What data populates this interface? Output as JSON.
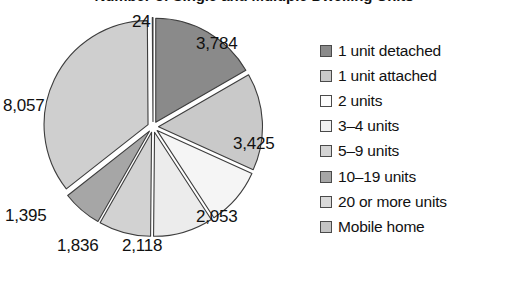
{
  "chart_data": {
    "type": "pie",
    "title": "Number of Single and Multiple Dwelling Units",
    "title_cropped": true,
    "units": "thousands of units",
    "categories": [
      "1 unit detached",
      "1 unit attached",
      "2 units",
      "3–4 units",
      "5–9 units",
      "10–19 units",
      "20 or more units",
      "Mobile home"
    ],
    "values": [
      3784,
      3425,
      2053,
      2118,
      1836,
      1395,
      8057,
      24
    ],
    "value_labels": [
      "3,784",
      "3,425",
      "2,053",
      "2,118",
      "1,836",
      "1,395",
      "8,057",
      "24"
    ],
    "colors": [
      "#8a8a8a",
      "#c9c9c9",
      "#f5f5f5",
      "#ececec",
      "#d2d2d2",
      "#a6a6a6",
      "#cfcfcf",
      "#c2c2c2"
    ],
    "total": 22692,
    "exploded": true,
    "legend_position": "right",
    "grid": false,
    "start_angle_deg": 0,
    "direction": "clockwise"
  },
  "figure": {
    "title": "Number of Single and Multiple Dwelling Units"
  },
  "labels": [
    {
      "text": "24",
      "x": 132,
      "y": 4,
      "align": "left"
    },
    {
      "text": "3,784",
      "x": 196,
      "y": 26,
      "align": "left"
    },
    {
      "text": "3,425",
      "x": 233,
      "y": 126,
      "align": "left"
    },
    {
      "text": "2,053",
      "x": 196,
      "y": 199,
      "align": "left"
    },
    {
      "text": "2,118",
      "x": 122,
      "y": 228,
      "align": "left"
    },
    {
      "text": "1,836",
      "x": 57,
      "y": 228,
      "align": "left"
    },
    {
      "text": "1,395",
      "x": 5,
      "y": 198,
      "align": "left"
    },
    {
      "text": "8,057",
      "x": 3,
      "y": 88,
      "align": "left"
    }
  ],
  "legend": {
    "items": [
      {
        "label": "1 unit detached",
        "color": "#8a8a8a"
      },
      {
        "label": "1 unit attached",
        "color": "#c9c9c9"
      },
      {
        "label": "2 units",
        "color": "#fcfcfc"
      },
      {
        "label": "3–4 units",
        "color": "#f0f0f0"
      },
      {
        "label": "5–9 units",
        "color": "#d4d4d4"
      },
      {
        "label": "10–19 units",
        "color": "#a6a6a6"
      },
      {
        "label": "20 or more units",
        "color": "#d9d9d9"
      },
      {
        "label": "Mobile home",
        "color": "#c4c4c4"
      }
    ]
  }
}
